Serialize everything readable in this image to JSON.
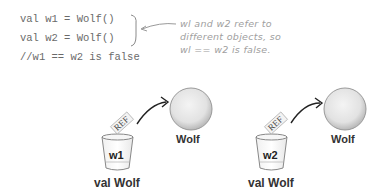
{
  "code": {
    "lines": [
      "val w1 = Wolf()",
      "val w2 = Wolf()",
      "//w1 == w2 is false"
    ]
  },
  "annotation": {
    "lines": [
      "wl and w2 refer to",
      "different objects, so",
      "wl == w2 is false."
    ]
  },
  "diagram": {
    "left": {
      "object_label": "Wolf",
      "ref_label": "REF",
      "variable_name": "w1",
      "variable_type": "val Wolf"
    },
    "right": {
      "object_label": "Wolf",
      "ref_label": "REF",
      "variable_name": "w2",
      "variable_type": "val Wolf"
    }
  },
  "colors": {
    "code_text": "#6a6a6a",
    "annotation_text": "#a0a0a0",
    "object_fill": "#e8e8e8",
    "label_text": "#333333"
  }
}
